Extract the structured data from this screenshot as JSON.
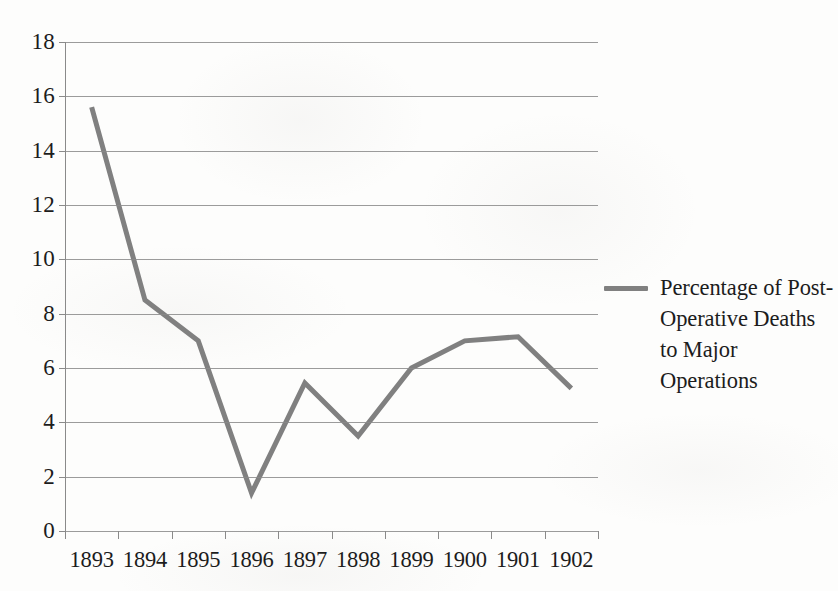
{
  "chart_data": {
    "type": "line",
    "title": "",
    "xlabel": "",
    "ylabel": "",
    "categories": [
      "1893",
      "1894",
      "1895",
      "1896",
      "1897",
      "1898",
      "1899",
      "1900",
      "1901",
      "1902"
    ],
    "series": [
      {
        "name": "Percentage of Post-Operative Deaths to Major Operations",
        "values": [
          15.6,
          8.5,
          7.0,
          1.4,
          5.45,
          3.5,
          6.0,
          7.0,
          7.15,
          5.25
        ],
        "color": "#808080"
      }
    ],
    "ylim": [
      0,
      18
    ],
    "ytick_labels": [
      "0",
      "2",
      "4",
      "6",
      "8",
      "10",
      "12",
      "14",
      "16",
      "18"
    ],
    "yticks": [
      0,
      2,
      4,
      6,
      8,
      10,
      12,
      14,
      16,
      18
    ],
    "grid": "horizontal",
    "legend_position": "right",
    "legend_entries": [
      "Percentage of Post-Operative Deaths to Major Operations"
    ]
  },
  "legend": {
    "entry_label": "Percentage of Post-Operative Deaths to Major Operations",
    "swatch_color": "#808080"
  },
  "axis": {
    "grid_color": "#8a8a8a",
    "text_color": "#1c1c1c"
  }
}
